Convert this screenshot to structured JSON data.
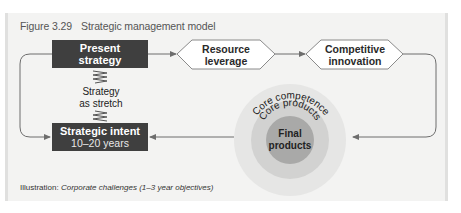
{
  "figure": {
    "number": "Figure 3.29",
    "title": "Strategic management model"
  },
  "nodes": {
    "present_strategy": {
      "line1": "Present",
      "line2": "strategy"
    },
    "strategic_intent": {
      "line1": "Strategic intent",
      "line2": "10–20 years"
    },
    "resource_leverage": {
      "line1": "Resource",
      "line2": "leverage"
    },
    "competitive_innovation": {
      "line1": "Competitive",
      "line2": "innovation"
    },
    "strategy_stretch": {
      "line1": "Strategy",
      "line2": "as stretch"
    }
  },
  "circles": {
    "outer": "Core competence",
    "middle": "Core products",
    "inner_line1": "Final",
    "inner_line2": "products"
  },
  "caption": {
    "prefix": "Illustration:",
    "text": "Corporate challenges (1–3 year objectives)"
  },
  "colors": {
    "dark_box": "#3f3f3f",
    "panel_bg": "#f3f3f2",
    "outer_circle": "#e6e6e5",
    "middle_circle": "#d2d2d1",
    "inner_circle": "#a9a9a8",
    "line": "#6d6d6d"
  }
}
